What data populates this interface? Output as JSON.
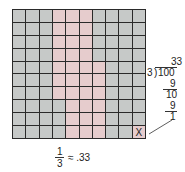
{
  "diagram": {
    "grid": {
      "rows": 10,
      "cols": 10,
      "shaded_color": "#e6cccd",
      "unshaded_color": "#c6c9c8",
      "line_color": "#2a2a2a",
      "shaded_cells_per_row": [
        [
          3,
          4,
          5
        ],
        [
          3,
          4,
          5
        ],
        [
          3,
          4,
          5
        ],
        [
          3,
          4,
          5
        ],
        [
          3,
          4,
          5,
          6
        ],
        [
          3,
          4,
          5,
          6
        ],
        [
          3,
          4,
          5,
          6
        ],
        [
          4,
          5,
          6
        ],
        [
          4,
          5,
          6
        ],
        [
          4,
          5,
          6
        ]
      ],
      "shaded_count": 33,
      "remainder_cell": {
        "row": 9,
        "col": 9,
        "label": "X"
      }
    },
    "long_division": {
      "quotient": "33",
      "divisor": "3",
      "dividend": "100",
      "step1_subtract": "9",
      "step1_result": "10",
      "step2_subtract": "9",
      "remainder": "1"
    },
    "caption": {
      "numerator": "1",
      "denominator": "3",
      "approx_symbol": "≈",
      "value": ".33"
    }
  }
}
